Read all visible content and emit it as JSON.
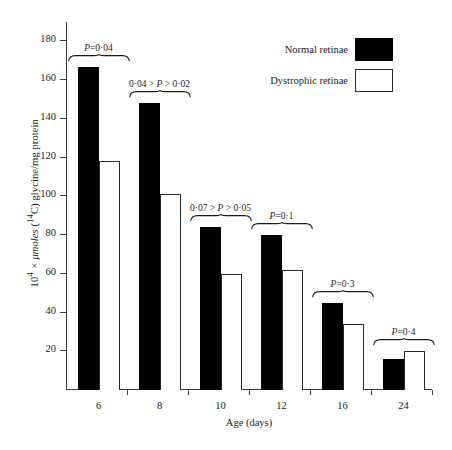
{
  "chart_data": {
    "type": "bar",
    "title": "",
    "xlabel": "Age (days)",
    "ylabel_parts": {
      "prefix": "10",
      "exponent": "4",
      "mid": " × μmoles (",
      "isotope": "14",
      "suffix": "C) glycine/mg protein"
    },
    "ylabel": "10⁴ × μmoles (¹⁴C) glycine/mg protein",
    "categories": [
      "6",
      "8",
      "10",
      "12",
      "16",
      "24"
    ],
    "ylim": [
      0,
      190
    ],
    "yticks": [
      20,
      40,
      60,
      80,
      100,
      120,
      140,
      160,
      180
    ],
    "grid": false,
    "legend_position": "top-right",
    "series": [
      {
        "name": "Normal retinae",
        "color": "#000000",
        "values": [
          167,
          148,
          84,
          80,
          45,
          16
        ]
      },
      {
        "name": "Dystrophic retinae",
        "color": "#ffffff",
        "values": [
          118,
          101,
          60,
          62,
          34,
          20
        ]
      }
    ],
    "annotations": [
      {
        "category": "6",
        "text": "P=0·04"
      },
      {
        "category": "8",
        "text": "0·04 > P > 0·02"
      },
      {
        "category": "10",
        "text": "0·07 > P > 0·05"
      },
      {
        "category": "12",
        "text": "P=0·1"
      },
      {
        "category": "16",
        "text": "P=0·3"
      },
      {
        "category": "24",
        "text": "P=0·4"
      }
    ]
  },
  "legend": {
    "items": [
      {
        "label": "Normal retinae",
        "swatch": "black"
      },
      {
        "label": "Dystrophic retinae",
        "swatch": "white"
      }
    ]
  },
  "caption": {
    "text": ""
  }
}
